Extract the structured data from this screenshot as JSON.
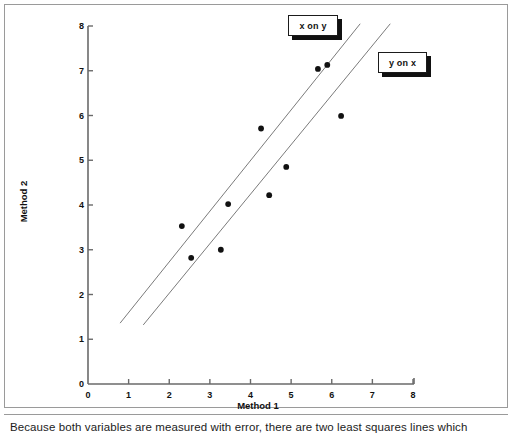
{
  "figure": {
    "caption": "Because both variables are measured with error, there are two least squares lines which"
  },
  "chart_data": {
    "type": "scatter",
    "title": "",
    "xlabel": "Method 1",
    "ylabel": "Method 2",
    "xlim": [
      0,
      8
    ],
    "ylim": [
      0,
      8
    ],
    "xticks": [
      "0",
      "1",
      "2",
      "3",
      "4",
      "5",
      "6",
      "7",
      "8"
    ],
    "yticks": [
      "0",
      "1",
      "2",
      "3",
      "4",
      "5",
      "6",
      "7",
      "8"
    ],
    "grid": false,
    "legend_position": "upper-right-callouts",
    "points": [
      {
        "x": 2.31,
        "y": 3.53
      },
      {
        "x": 2.54,
        "y": 2.82
      },
      {
        "x": 3.27,
        "y": 3.0
      },
      {
        "x": 3.45,
        "y": 4.02
      },
      {
        "x": 4.26,
        "y": 5.71
      },
      {
        "x": 4.46,
        "y": 4.22
      },
      {
        "x": 4.88,
        "y": 4.85
      },
      {
        "x": 5.66,
        "y": 7.04
      },
      {
        "x": 5.89,
        "y": 7.13
      },
      {
        "x": 6.23,
        "y": 5.99
      }
    ],
    "lines": [
      {
        "name": "x on y",
        "label": "x on y",
        "x_start": 0.79,
        "y_start": 1.36,
        "x_end": 6.7,
        "y_end": 8.05
      },
      {
        "name": "y on x",
        "label": "y on x",
        "x_start": 1.36,
        "y_start": 1.32,
        "x_end": 7.44,
        "y_end": 8.05
      }
    ],
    "marker": {
      "shape": "circle",
      "color": "#111111",
      "size": 5
    },
    "line_color": "#6b6b6b",
    "axis_color": "#6a6a6a"
  },
  "colors": {
    "background": "#ffffff",
    "frame": "#9a9a9a",
    "text": "#1a1a1a",
    "marker": "#111111",
    "regression_line": "#6b6b6b"
  }
}
